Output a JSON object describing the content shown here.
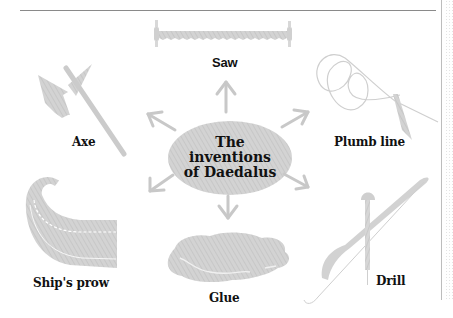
{
  "diagram": {
    "center": {
      "lines": [
        "The",
        "inventions",
        "of Daedalus"
      ]
    },
    "inventions": [
      {
        "label": "Saw",
        "icon": "saw-icon"
      },
      {
        "label": "Plumb line",
        "icon": "plumb-line-icon"
      },
      {
        "label": "Drill",
        "icon": "drill-icon"
      },
      {
        "label": "Glue",
        "icon": "glue-icon"
      },
      {
        "label": "Ship's prow",
        "icon": "ship-prow-icon"
      },
      {
        "label": "Axe",
        "icon": "axe-icon"
      }
    ],
    "colors": {
      "fill": "#cfcfcf",
      "arrow": "#c4c4c4",
      "text": "#111111",
      "rule": "#8a8a8a"
    }
  }
}
